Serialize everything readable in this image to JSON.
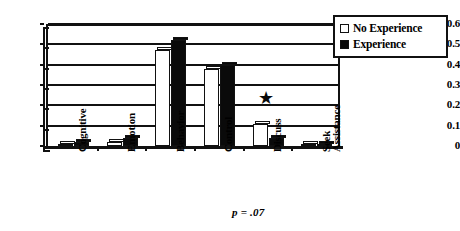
{
  "chart_data": {
    "type": "bar",
    "title": "",
    "subtitle": "",
    "xlabel": "",
    "ylabel": "",
    "categories": [
      "Cognitive",
      "Emotion",
      "Behavior",
      "Control",
      "Discuss",
      "Seek\nAssistance"
    ],
    "series": [
      {
        "name": "No Experience",
        "fill": "white",
        "values": [
          0.01,
          0.02,
          0.47,
          0.38,
          0.11,
          0.005
        ]
      },
      {
        "name": "Experience",
        "fill": "black",
        "values": [
          0.02,
          0.04,
          0.52,
          0.4,
          0.04,
          0.01
        ]
      }
    ],
    "ylim": [
      0,
      0.6
    ],
    "yticks": [
      "0",
      "0.1",
      "0.2",
      "0.3",
      "0.4",
      "0.5",
      "0.6"
    ],
    "ytick_values": [
      0,
      0.1,
      0.2,
      0.3,
      0.4,
      0.5,
      0.6
    ],
    "grid": true,
    "legend_position": "top-right",
    "annotations": [
      {
        "name": "significance-star",
        "text": "★",
        "category": "Discuss",
        "y": 0.22
      },
      {
        "name": "p-value-note",
        "text": "p = .07"
      }
    ]
  },
  "legend": {
    "entries": [
      {
        "label": "No Experience",
        "swatch": "white-square-icon"
      },
      {
        "label": "Experience",
        "swatch": "black-square-icon"
      }
    ]
  },
  "annotations": {
    "star": "★",
    "pvalue": "p = .07"
  },
  "colors": {
    "axis": "#111111",
    "series_no_experience": "#ffffff",
    "series_experience": "#0a0a0a",
    "background": "#ffffff"
  }
}
